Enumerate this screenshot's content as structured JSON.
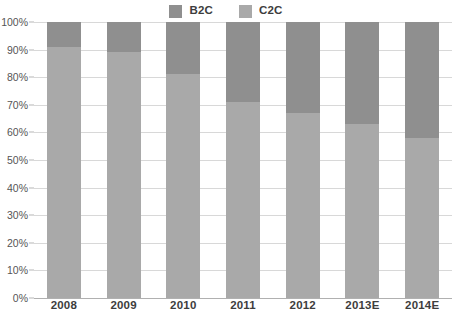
{
  "chart_data": {
    "type": "bar",
    "subtype": "stacked-100-percent",
    "title": "",
    "xlabel": "",
    "ylabel": "",
    "ylim": [
      0,
      100
    ],
    "ytick_labels": [
      "0%",
      "10%",
      "20%",
      "30%",
      "40%",
      "50%",
      "60%",
      "70%",
      "80%",
      "90%",
      "100%"
    ],
    "ytick_values": [
      0,
      10,
      20,
      30,
      40,
      50,
      60,
      70,
      80,
      90,
      100
    ],
    "grid": "horizontal",
    "legend_position": "top-center",
    "categories": [
      "2008",
      "2009",
      "2010",
      "2011",
      "2012",
      "2013E",
      "2014E"
    ],
    "series": [
      {
        "name": "B2C",
        "color": "#8f8f8f",
        "values": [
          9,
          11,
          19,
          29,
          33,
          37,
          42
        ]
      },
      {
        "name": "C2C",
        "color": "#a9a9a9",
        "values": [
          91,
          89,
          81,
          71,
          67,
          63,
          58
        ]
      }
    ]
  },
  "legend": {
    "items": [
      {
        "label": "B2C",
        "color": "#8f8f8f",
        "swatch_name": "legend-swatch-b2c"
      },
      {
        "label": "C2C",
        "color": "#a9a9a9",
        "swatch_name": "legend-swatch-c2c"
      }
    ]
  },
  "axes": {
    "y": {
      "ticks": [
        "100%",
        "90%",
        "80%",
        "70%",
        "60%",
        "50%",
        "40%",
        "30%",
        "20%",
        "10%",
        "0%"
      ]
    },
    "x": {
      "ticks": [
        "2008",
        "2009",
        "2010",
        "2011",
        "2012",
        "2013E",
        "2014E"
      ]
    }
  },
  "colors": {
    "b2c": "#8f8f8f",
    "c2c": "#a9a9a9",
    "gridline": "#d8d8d8",
    "axis": "#b0b0b0",
    "text": "#3d3d3d"
  }
}
